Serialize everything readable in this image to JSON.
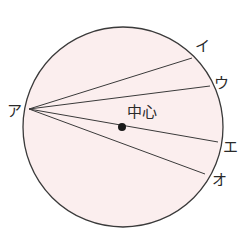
{
  "diagram": {
    "type": "circle-chords",
    "colors": {
      "fill": "#fbeeee",
      "stroke": "#3a3a3a",
      "background": "#ffffff"
    },
    "circle": {
      "cx": 123,
      "cy": 127,
      "r": 100
    },
    "center_label": "中心",
    "origin": {
      "label": "ア",
      "x": 23,
      "y": 109
    },
    "endpoints": [
      {
        "label": "イ",
        "x": 192,
        "y": 58
      },
      {
        "label": "ウ",
        "x": 210,
        "y": 86
      },
      {
        "label": "エ",
        "x": 218,
        "y": 142
      },
      {
        "label": "オ",
        "x": 205,
        "y": 174
      }
    ]
  }
}
